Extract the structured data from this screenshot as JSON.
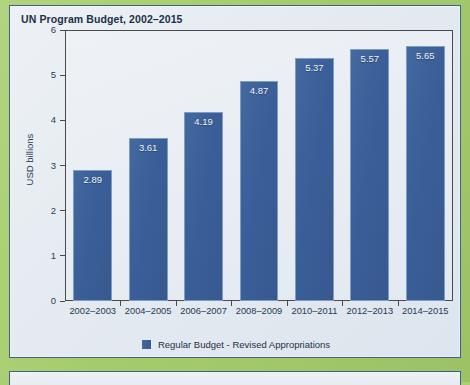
{
  "page": {
    "background_color": "#a9cf70",
    "card_border_color": "#3c6488"
  },
  "chart_data": {
    "type": "bar",
    "title": "UN Program Budget, 2002–2015",
    "xlabel": "",
    "ylabel": "USD billions",
    "categories": [
      "2002–2003",
      "2004–2005",
      "2006–2007",
      "2008–2009",
      "2010–2011",
      "2012–2013",
      "2014–2015"
    ],
    "values": [
      2.89,
      3.61,
      4.19,
      4.87,
      5.37,
      5.57,
      5.65
    ],
    "value_labels": [
      "2.89",
      "3.61",
      "4.19",
      "4.87",
      "5.37",
      "5.57",
      "5.65"
    ],
    "ylim": [
      0,
      6
    ],
    "yticks": [
      0,
      1,
      2,
      3,
      4,
      5,
      6
    ],
    "ytick_labels": [
      "0",
      "1",
      "2",
      "3",
      "4",
      "5",
      "6"
    ],
    "grid": false,
    "legend_position": "bottom",
    "series": [
      {
        "name": "Regular Budget - Revised Appropriations",
        "color": "#3a5f99",
        "values": [
          2.89,
          3.61,
          4.19,
          4.87,
          5.37,
          5.57,
          5.65
        ]
      }
    ]
  },
  "legend": {
    "items": [
      {
        "label": "Regular Budget - Revised Appropriations",
        "color": "#3a5f99"
      }
    ]
  }
}
